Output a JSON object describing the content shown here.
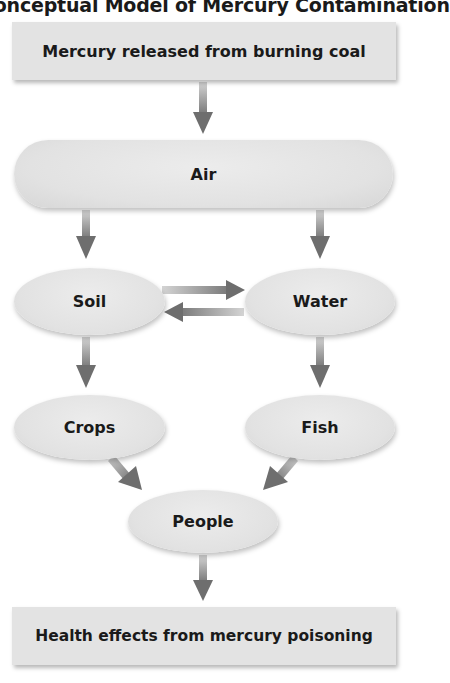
{
  "title": "Conceptual Model of Mercury Contamination",
  "nodes": {
    "source": "Mercury released from burning coal",
    "air": "Air",
    "soil": "Soil",
    "water": "Water",
    "crops": "Crops",
    "fish": "Fish",
    "people": "People",
    "outcome": "Health effects from mercury poisoning"
  },
  "edges": [
    {
      "from": "source",
      "to": "air"
    },
    {
      "from": "air",
      "to": "soil"
    },
    {
      "from": "air",
      "to": "water"
    },
    {
      "from": "soil",
      "to": "water"
    },
    {
      "from": "water",
      "to": "soil"
    },
    {
      "from": "soil",
      "to": "crops"
    },
    {
      "from": "water",
      "to": "fish"
    },
    {
      "from": "crops",
      "to": "people"
    },
    {
      "from": "fish",
      "to": "people"
    },
    {
      "from": "people",
      "to": "outcome"
    }
  ],
  "colors": {
    "node_fill": "#e3e3e3",
    "arrow": "#6e6e6e",
    "text": "#1a1a1a"
  }
}
